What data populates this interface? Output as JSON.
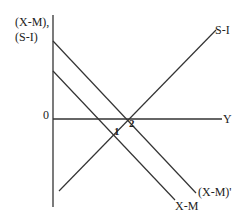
{
  "diagram": {
    "type": "economics-line-diagram",
    "y_axis_label_line1": "(X-M),",
    "y_axis_label_line2": "(S-I)",
    "x_axis_label": "Y",
    "origin_label": "0",
    "curves": [
      {
        "name": "S-I",
        "label": "S-I",
        "slope": "upward"
      },
      {
        "name": "X-M",
        "label": "X-M",
        "slope": "downward"
      },
      {
        "name": "(X-M)'",
        "label": "(X-M)'",
        "slope": "downward",
        "note": "shifted up from X-M"
      }
    ],
    "intersection_points": [
      {
        "label": "1",
        "between": [
          "S-I",
          "X-M"
        ]
      },
      {
        "label": "2",
        "between": [
          "S-I",
          "(X-M)'"
        ]
      }
    ],
    "line_color": "#333333"
  }
}
